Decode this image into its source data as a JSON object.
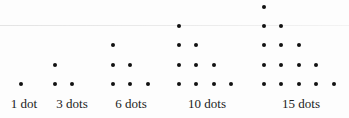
{
  "figure": {
    "groups": [
      {
        "label": "1 dot",
        "count": 1,
        "rows": 1,
        "center_x": 24
      },
      {
        "label": "3 dots",
        "count": 3,
        "rows": 2,
        "center_x": 72
      },
      {
        "label": "6 dots",
        "count": 6,
        "rows": 3,
        "center_x": 131
      },
      {
        "label": "10 dots",
        "count": 10,
        "rows": 4,
        "center_x": 207
      },
      {
        "label": "15 dots",
        "count": 15,
        "rows": 5,
        "center_x": 301
      }
    ],
    "dot_color": "#111111",
    "text_color": "#222222"
  },
  "layout": {
    "first_col_x": [
      21,
      55,
      113,
      179,
      264
    ],
    "col_spacing": 17.4,
    "bottom_row_y": 84,
    "row_spacing": 19.3
  }
}
